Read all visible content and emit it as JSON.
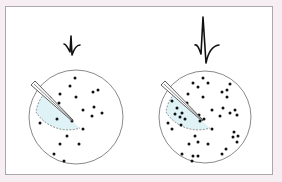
{
  "figure": {
    "colors": {
      "background": "#f6eef2",
      "frame_border": "#a9a7aa",
      "panel": "#ffffff",
      "circle_stroke": "#7a7a7a",
      "dot": "#111111",
      "recording_zone_fill": "#dff3f7",
      "recording_zone_stroke": "#6a6a6a",
      "waveform": "#111111"
    },
    "panels": [
      {
        "name": "sparse",
        "waveform": "small-spike",
        "neuron_count": 21,
        "dots": [
          [
            75,
            78
          ],
          [
            70,
            86
          ],
          [
            93,
            92
          ],
          [
            98,
            90
          ],
          [
            60,
            94
          ],
          [
            76,
            97
          ],
          [
            50,
            98
          ],
          [
            59,
            103
          ],
          [
            83,
            110
          ],
          [
            94,
            107
          ],
          [
            102,
            113
          ],
          [
            92,
            116
          ],
          [
            57,
            119
          ],
          [
            72,
            121
          ],
          [
            40,
            123
          ],
          [
            83,
            129
          ],
          [
            67,
            136
          ],
          [
            60,
            144
          ],
          [
            79,
            144
          ],
          [
            54,
            154
          ],
          [
            64,
            161
          ]
        ]
      },
      {
        "name": "dense",
        "waveform": "large-spike",
        "neuron_count": 47,
        "dots": [
          [
            203,
            78
          ],
          [
            193,
            83
          ],
          [
            208,
            83
          ],
          [
            198,
            87
          ],
          [
            230,
            84
          ],
          [
            222,
            92
          ],
          [
            227,
            90
          ],
          [
            227,
            97
          ],
          [
            188,
            94
          ],
          [
            203,
            97
          ],
          [
            178,
            97
          ],
          [
            172,
            101
          ],
          [
            187,
            103
          ],
          [
            223,
            108
          ],
          [
            212,
            110
          ],
          [
            230,
            113
          ],
          [
            235,
            110
          ],
          [
            237,
            115
          ],
          [
            220,
            116
          ],
          [
            177,
            108
          ],
          [
            182,
            113
          ],
          [
            175,
            114
          ],
          [
            199,
            115
          ],
          [
            180,
            117
          ],
          [
            185,
            119
          ],
          [
            204,
            119
          ],
          [
            200,
            121
          ],
          [
            168,
            123
          ],
          [
            181,
            125
          ],
          [
            172,
            129
          ],
          [
            212,
            129
          ],
          [
            195,
            136
          ],
          [
            234,
            132
          ],
          [
            238,
            136
          ],
          [
            233,
            137
          ],
          [
            237,
            142
          ],
          [
            198,
            142
          ],
          [
            189,
            144
          ],
          [
            208,
            144
          ],
          [
            226,
            149
          ],
          [
            222,
            154
          ],
          [
            182,
            154
          ],
          [
            193,
            156
          ],
          [
            198,
            156
          ],
          [
            192,
            161
          ]
        ]
      }
    ]
  }
}
